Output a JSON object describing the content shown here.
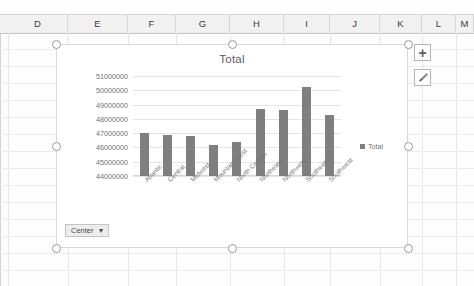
{
  "spreadsheet": {
    "columns": [
      {
        "label": "D",
        "left": 8,
        "width": 60
      },
      {
        "label": "E",
        "left": 68,
        "width": 60
      },
      {
        "label": "F",
        "left": 128,
        "width": 48
      },
      {
        "label": "G",
        "left": 176,
        "width": 54
      },
      {
        "label": "H",
        "left": 230,
        "width": 54
      },
      {
        "label": "I",
        "left": 284,
        "width": 46
      },
      {
        "label": "J",
        "left": 330,
        "width": 50
      },
      {
        "label": "K",
        "left": 380,
        "width": 42
      },
      {
        "label": "L",
        "left": 422,
        "width": 34
      },
      {
        "label": "M",
        "left": 456,
        "width": 18
      }
    ],
    "row_height": 17,
    "grid_color": "#ececec",
    "header_background": "#f1f1f1"
  },
  "chart": {
    "title": "Total",
    "selected": true,
    "bar_color": "#7f7f7f",
    "legend": {
      "position": "right",
      "entries": [
        "Total"
      ]
    },
    "align_button": {
      "label": "Center",
      "caret": "▾"
    }
  },
  "chart_tools": [
    {
      "name": "chart-elements-button",
      "icon": "plus-icon",
      "label": "+"
    },
    {
      "name": "chart-styles-button",
      "icon": "paintbrush-icon",
      "label": ""
    }
  ],
  "chart_data": {
    "type": "bar",
    "title": "Total",
    "xlabel": "",
    "ylabel": "",
    "categories": [
      "Atlantic",
      "Central",
      "Midwest",
      "Mountain West",
      "North Central",
      "Northeast",
      "Northwest",
      "Southeast",
      "Southwest"
    ],
    "values": [
      47000000,
      46900000,
      46800000,
      46200000,
      46400000,
      48700000,
      48600000,
      50200000,
      48300000
    ],
    "series": [
      {
        "name": "Total",
        "values": [
          47000000,
          46900000,
          46800000,
          46200000,
          46400000,
          48700000,
          48600000,
          50200000,
          48300000
        ]
      }
    ],
    "ylim": [
      44000000,
      51000000
    ],
    "ytick_values": [
      51000000,
      50000000,
      49000000,
      48000000,
      47000000,
      46000000,
      45000000,
      44000000
    ],
    "ytick_labels": [
      "51000000",
      "50000000",
      "49000000",
      "48000000",
      "47000000",
      "46000000",
      "45000000",
      "44000000"
    ],
    "grid": true,
    "legend_position": "right"
  }
}
